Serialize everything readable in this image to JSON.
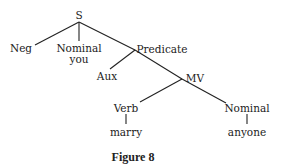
{
  "figure": {
    "caption": "Figure 8",
    "nodes": {
      "s": "S",
      "neg": "Neg",
      "nominal_1": "Nominal",
      "you": "you",
      "predicate": "Predicate",
      "aux": "Aux",
      "mv": "MV",
      "verb": "Verb",
      "marry": "marry",
      "nominal_2": "Nominal",
      "anyone": "anyone"
    },
    "edges": [
      [
        "S",
        "Neg"
      ],
      [
        "S",
        "Nominal"
      ],
      [
        "S",
        "Predicate"
      ],
      [
        "Nominal",
        "you"
      ],
      [
        "Predicate",
        "Aux"
      ],
      [
        "Predicate",
        "MV"
      ],
      [
        "MV",
        "Verb"
      ],
      [
        "MV",
        "Nominal"
      ],
      [
        "Verb",
        "marry"
      ],
      [
        "Nominal",
        "anyone"
      ]
    ],
    "line_color": "#222222"
  }
}
